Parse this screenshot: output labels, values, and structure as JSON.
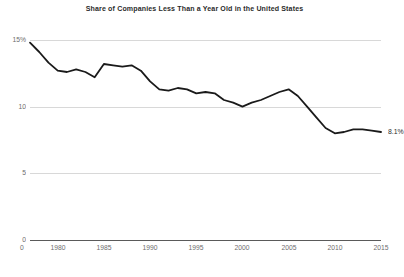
{
  "chart_data": {
    "type": "line",
    "title": "Share of Companies Less Than a Year Old in the United States",
    "xlabel": "",
    "ylabel": "",
    "ylim": [
      0,
      15
    ],
    "xlim": [
      1977,
      2015
    ],
    "grid": true,
    "legend": "none",
    "y_ticks": [
      "15%",
      "10",
      "5",
      "0"
    ],
    "y_tick_values": [
      15,
      10,
      5,
      0
    ],
    "x_ticks": [
      "1980",
      "1985",
      "1990",
      "1995",
      "2000",
      "2005",
      "2010",
      "2015"
    ],
    "x_tick_values": [
      1980,
      1985,
      1990,
      1995,
      2000,
      2005,
      2010,
      2015
    ],
    "x_origin_tick": "0",
    "line_color": "#1a1a1a",
    "end_label": "8.1%",
    "x": [
      1977,
      1978,
      1979,
      1980,
      1981,
      1982,
      1983,
      1984,
      1985,
      1986,
      1987,
      1988,
      1989,
      1990,
      1991,
      1992,
      1993,
      1994,
      1995,
      1996,
      1997,
      1998,
      1999,
      2000,
      2001,
      2002,
      2003,
      2004,
      2005,
      2006,
      2007,
      2008,
      2009,
      2010,
      2011,
      2012,
      2013,
      2014,
      2015
    ],
    "values": [
      14.8,
      14.1,
      13.3,
      12.7,
      12.6,
      12.8,
      12.6,
      12.2,
      13.2,
      13.1,
      13.0,
      13.1,
      12.7,
      11.9,
      11.3,
      11.2,
      11.4,
      11.3,
      11.0,
      11.1,
      11.0,
      10.5,
      10.3,
      10.0,
      10.3,
      10.5,
      10.8,
      11.1,
      11.3,
      10.8,
      10.0,
      9.2,
      8.4,
      8.0,
      8.1,
      8.3,
      8.3,
      8.2,
      8.1
    ]
  },
  "footer": {
    "caption": ""
  }
}
